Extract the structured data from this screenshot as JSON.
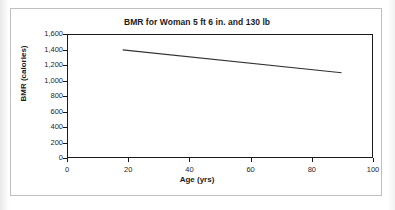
{
  "figure": {
    "background_color": "#ffffff",
    "frame_color": "#bfbfbf",
    "axis_color": "#1a1a1a",
    "line_color": "#333333"
  },
  "chart_data": {
    "type": "line",
    "title": "BMR for Woman 5 ft 6 in. and 130 lb",
    "xlabel": "Age (yrs)",
    "ylabel": "BMR (calories)",
    "xlim": [
      0,
      100
    ],
    "ylim": [
      0,
      1600
    ],
    "xticks": [
      0,
      20,
      40,
      60,
      80,
      100
    ],
    "xtick_labels": [
      "0",
      "20",
      "40",
      "60",
      "80",
      "100"
    ],
    "yticks": [
      0,
      200,
      400,
      600,
      800,
      1000,
      1200,
      1400,
      1600
    ],
    "ytick_labels": [
      "0",
      "200",
      "400",
      "600",
      "800",
      "1,000",
      "1,200",
      "1,400",
      "1,600"
    ],
    "grid": false,
    "legend": false,
    "series": [
      {
        "name": "BMR",
        "color": "#333333",
        "x": [
          18,
          90
        ],
        "y": [
          1405,
          1105
        ]
      }
    ]
  }
}
